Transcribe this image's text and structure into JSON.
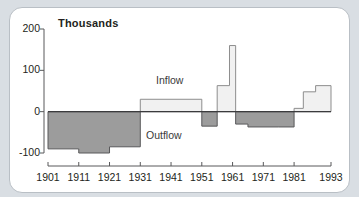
{
  "figure": {
    "title": "Thousands",
    "panel_bg": "#ffffff",
    "page_bg": "#d9dee3",
    "inflow_color": "#f1f1f1",
    "outflow_color": "#9c9c9c",
    "line_color": "#58585a"
  },
  "labels": {
    "inflow": "Inflow",
    "outflow": "Outflow"
  },
  "yticks": [
    "200",
    "100",
    "0",
    "-100"
  ],
  "xticks": [
    "1901",
    "1911",
    "1921",
    "1931",
    "1941",
    "1951",
    "1961",
    "1971",
    "1981",
    "1993"
  ],
  "chart_data": {
    "type": "area",
    "title": "Thousands",
    "xlabel": "",
    "ylabel": "Thousands",
    "ylim": [
      -100,
      200
    ],
    "xlim": [
      1901,
      1993
    ],
    "grid": false,
    "legend": "inline",
    "annotations": [
      "Inflow",
      "Outflow"
    ],
    "x_tick_values": [
      1901,
      1911,
      1921,
      1931,
      1941,
      1951,
      1961,
      1971,
      1981,
      1993
    ],
    "y_tick_values": [
      200,
      100,
      0,
      -100
    ],
    "series": [
      {
        "name": "Net migration",
        "note": "Step series; positive values are Inflow (light fill), negative values are Outflow (dark fill). Units: thousands.",
        "steps": [
          {
            "x_start": 1901,
            "x_end": 1911,
            "value": -90
          },
          {
            "x_start": 1911,
            "x_end": 1921,
            "value": -100
          },
          {
            "x_start": 1921,
            "x_end": 1931,
            "value": -85
          },
          {
            "x_start": 1931,
            "x_end": 1951,
            "value": 30
          },
          {
            "x_start": 1951,
            "x_end": 1956,
            "value": -35
          },
          {
            "x_start": 1956,
            "x_end": 1960,
            "value": 63
          },
          {
            "x_start": 1960,
            "x_end": 1962,
            "value": 160
          },
          {
            "x_start": 1962,
            "x_end": 1966,
            "value": -30
          },
          {
            "x_start": 1966,
            "x_end": 1976,
            "value": -37
          },
          {
            "x_start": 1976,
            "x_end": 1981,
            "value": -37
          },
          {
            "x_start": 1981,
            "x_end": 1984,
            "value": 8
          },
          {
            "x_start": 1984,
            "x_end": 1988,
            "value": 48
          },
          {
            "x_start": 1988,
            "x_end": 1993,
            "value": 63
          }
        ]
      }
    ]
  }
}
